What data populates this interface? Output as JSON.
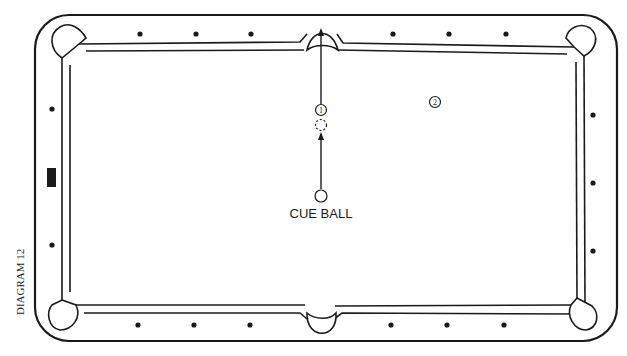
{
  "diagram": {
    "title": "DIAGRAM 12",
    "cue_ball_label": "CUE BALL",
    "balls": [
      {
        "id": "1",
        "label": "1",
        "x": 321,
        "y": 110
      },
      {
        "id": "2",
        "label": "2",
        "x": 435,
        "y": 102
      }
    ],
    "ghost_ball": {
      "x": 321,
      "y": 125
    },
    "cue_ball": {
      "x": 321,
      "y": 196
    },
    "colors": {
      "line": "#1a1a1a",
      "background": "#ffffff"
    },
    "diamonds": {
      "top": [
        140,
        196,
        251,
        393,
        449,
        506
      ],
      "bottom": [
        138,
        194,
        250,
        391,
        447,
        504
      ],
      "left": [
        109,
        245
      ],
      "right": [
        115,
        183,
        251
      ]
    }
  }
}
